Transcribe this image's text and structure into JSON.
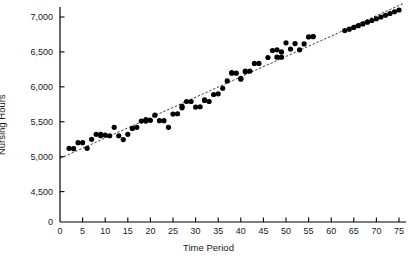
{
  "chart_data": {
    "type": "scatter",
    "title": "",
    "xlabel": "Time Period",
    "ylabel": "Nursing Hours",
    "xlim": [
      0,
      75
    ],
    "ylim": [
      4300,
      7100
    ],
    "y_axis_break": true,
    "y_zero_label": "0",
    "grid": false,
    "legend": "none",
    "xticks": [
      0,
      5,
      10,
      15,
      20,
      25,
      30,
      35,
      40,
      45,
      50,
      55,
      60,
      65,
      70,
      75
    ],
    "xtick_labels": [
      "0",
      "5",
      "10",
      "15",
      "20",
      "25",
      "30",
      "35",
      "40",
      "45",
      "50",
      "55",
      "60",
      "65",
      "70",
      "75"
    ],
    "yticks": [
      4500,
      5000,
      5500,
      6000,
      6500,
      7000
    ],
    "ytick_labels": [
      "4,500",
      "5,000",
      "5,500",
      "6,000",
      "6,500",
      "7,000"
    ],
    "marker": "filled-circle",
    "marker_color": "#000000",
    "marker_size": 2.6,
    "trendline": {
      "type": "linear",
      "style": "dashed",
      "color": "#000000",
      "intercept": 4975,
      "slope": 29.2,
      "x_start": 0,
      "x_end": 76
    },
    "x": [
      2,
      3,
      4,
      5,
      6,
      7,
      8,
      9,
      9,
      10,
      11,
      12,
      13,
      14,
      15,
      16,
      17,
      18,
      19,
      19,
      20,
      21,
      22,
      23,
      24,
      25,
      26,
      27,
      27,
      28,
      29,
      30,
      31,
      32,
      32,
      33,
      34,
      35,
      36,
      37,
      38,
      38,
      39,
      40,
      40,
      41,
      41,
      42,
      43,
      44,
      46,
      47,
      48,
      48,
      49,
      49,
      50,
      51,
      52,
      53,
      54,
      55,
      56,
      56,
      63,
      64,
      65,
      66,
      67,
      68,
      69,
      70,
      71,
      72,
      73,
      74,
      75
    ],
    "y": [
      5120,
      5115,
      5200,
      5200,
      5120,
      5250,
      5320,
      5320,
      5300,
      5310,
      5300,
      5420,
      5300,
      5245,
      5320,
      5405,
      5420,
      5510,
      5510,
      5530,
      5520,
      5595,
      5515,
      5515,
      5420,
      5610,
      5615,
      5700,
      5720,
      5790,
      5790,
      5710,
      5715,
      5805,
      5815,
      5790,
      5890,
      5900,
      5980,
      6085,
      6195,
      6205,
      6195,
      6120,
      6110,
      6215,
      6225,
      6225,
      6335,
      6335,
      6420,
      6520,
      6530,
      6425,
      6500,
      6425,
      6630,
      6540,
      6620,
      6530,
      6615,
      6715,
      6720,
      6720,
      6805,
      6825,
      6850,
      6875,
      6900,
      6925,
      6950,
      6975,
      7000,
      7025,
      7050,
      7075,
      7100
    ]
  },
  "axes_geometry": {
    "left_px": 60,
    "right_px": 399,
    "top_px": 10,
    "bottom_px": 222,
    "y_break_px": 200
  }
}
